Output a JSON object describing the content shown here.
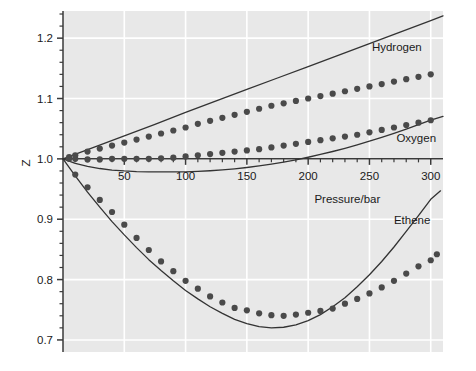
{
  "chart_data": {
    "type": "scatter",
    "title": "",
    "xlabel": "Pressure/bar",
    "ylabel": "Z",
    "xlim": [
      0,
      310
    ],
    "ylim": [
      0.68,
      1.245
    ],
    "xticks": [
      50,
      100,
      150,
      200,
      250,
      300
    ],
    "xtick_labels": [
      "50",
      "100",
      "150",
      "200",
      "250",
      "300"
    ],
    "yticks": [
      0.7,
      0.8,
      0.9,
      1.0,
      1.1,
      1.2
    ],
    "ytick_labels": [
      "0.7",
      "0.8",
      "0.9",
      "1.0",
      "1.1",
      "1.2"
    ],
    "x_minor_tick_step": 10,
    "y_minor_tick_step": 0.02,
    "grid": true,
    "grid_color": "#ffffff",
    "plot_bg": "#e8e8e8",
    "line_color": "#333333",
    "marker_color": "#4a4a4a",
    "marker_shape": "circle",
    "legend_position": "inline-annotations",
    "annotations": [
      {
        "name": "Hydrogen",
        "x": 252,
        "y": 1.178
      },
      {
        "name": "Oxygen",
        "x": 272,
        "y": 1.028
      },
      {
        "name": "Ethene",
        "x": 270,
        "y": 0.892
      }
    ],
    "series": [
      {
        "name": "Hydrogen",
        "style": "line",
        "comment": "perfect-gas-deviation reference line, Z rises linearly",
        "x": [
          0,
          25,
          50,
          75,
          100,
          125,
          150,
          175,
          200,
          225,
          250,
          275,
          300,
          310
        ],
        "values": [
          1.0,
          1.019,
          1.038,
          1.057,
          1.077,
          1.096,
          1.115,
          1.134,
          1.153,
          1.172,
          1.191,
          1.21,
          1.229,
          1.237
        ]
      },
      {
        "name": "Hydrogen",
        "style": "points",
        "x": [
          5,
          10,
          20,
          30,
          40,
          50,
          60,
          70,
          80,
          90,
          100,
          110,
          120,
          130,
          140,
          150,
          160,
          170,
          180,
          190,
          200,
          210,
          220,
          230,
          240,
          250,
          260,
          270,
          280,
          290,
          300
        ],
        "values": [
          1.003,
          1.006,
          1.012,
          1.017,
          1.022,
          1.027,
          1.032,
          1.037,
          1.042,
          1.047,
          1.052,
          1.058,
          1.063,
          1.068,
          1.073,
          1.078,
          1.083,
          1.088,
          1.092,
          1.096,
          1.1,
          1.104,
          1.108,
          1.112,
          1.116,
          1.12,
          1.124,
          1.128,
          1.132,
          1.136,
          1.14
        ]
      },
      {
        "name": "Oxygen",
        "style": "line",
        "comment": "dips below unity, minimum near 130 bar, crosses Z=1 near 245 bar",
        "x": [
          0,
          10,
          20,
          30,
          40,
          50,
          60,
          70,
          80,
          90,
          100,
          110,
          120,
          130,
          140,
          150,
          160,
          170,
          180,
          190,
          200,
          210,
          220,
          230,
          240,
          250,
          260,
          270,
          280,
          290,
          300,
          310
        ],
        "values": [
          1.0,
          0.9925,
          0.9875,
          0.984,
          0.9815,
          0.98,
          0.979,
          0.9785,
          0.9783,
          0.9783,
          0.9786,
          0.9793,
          0.9803,
          0.9817,
          0.9835,
          0.9857,
          0.9883,
          0.9913,
          0.9947,
          0.9985,
          1.0027,
          1.0073,
          1.0122,
          1.0175,
          1.0232,
          1.0292,
          1.0356,
          1.0423,
          1.0493,
          1.0566,
          1.0642,
          1.0705
        ]
      },
      {
        "name": "Oxygen",
        "style": "points",
        "x": [
          5,
          10,
          20,
          30,
          40,
          50,
          60,
          70,
          80,
          90,
          100,
          110,
          120,
          130,
          140,
          150,
          160,
          170,
          180,
          190,
          200,
          210,
          220,
          230,
          240,
          250,
          260,
          270,
          280,
          290,
          300
        ],
        "values": [
          1.0,
          1.0,
          0.999,
          0.999,
          1.0,
          1.0,
          1.0,
          1.0,
          1.001,
          1.002,
          1.004,
          1.006,
          1.008,
          1.01,
          1.012,
          1.014,
          1.016,
          1.019,
          1.022,
          1.025,
          1.028,
          1.031,
          1.034,
          1.037,
          1.04,
          1.044,
          1.048,
          1.052,
          1.056,
          1.06,
          1.064
        ]
      },
      {
        "name": "Ethene",
        "style": "line",
        "comment": "strong negative deviation, minimum Z ~0.705 near 150 bar",
        "x": [
          0,
          10,
          20,
          30,
          40,
          50,
          60,
          70,
          80,
          90,
          100,
          110,
          120,
          130,
          140,
          150,
          160,
          170,
          180,
          190,
          200,
          210,
          220,
          230,
          240,
          250,
          260,
          270,
          280,
          290,
          300,
          308
        ],
        "values": [
          1.0,
          0.972,
          0.945,
          0.92,
          0.896,
          0.874,
          0.853,
          0.833,
          0.815,
          0.798,
          0.782,
          0.768,
          0.755,
          0.744,
          0.734,
          0.727,
          0.722,
          0.72,
          0.721,
          0.725,
          0.732,
          0.742,
          0.755,
          0.77,
          0.788,
          0.808,
          0.83,
          0.854,
          0.88,
          0.906,
          0.933,
          0.947
        ]
      },
      {
        "name": "Ethene",
        "style": "points",
        "x": [
          10,
          20,
          30,
          40,
          50,
          60,
          70,
          80,
          90,
          100,
          110,
          120,
          130,
          140,
          150,
          160,
          170,
          180,
          190,
          200,
          210,
          220,
          230,
          240,
          250,
          260,
          270,
          280,
          290,
          300
        ],
        "values": [
          0.974,
          0.953,
          0.932,
          0.912,
          0.891,
          0.869,
          0.849,
          0.83,
          0.814,
          0.798,
          0.785,
          0.772,
          0.762,
          0.753,
          0.749,
          0.744,
          0.741,
          0.74,
          0.742,
          0.745,
          0.748,
          0.752,
          0.76,
          0.768,
          0.777,
          0.787,
          0.798,
          0.81,
          0.822,
          0.832
        ]
      },
      {
        "name": "Ethene-tail",
        "style": "points",
        "x": [
          305
        ],
        "values": [
          0.842
        ]
      }
    ]
  }
}
